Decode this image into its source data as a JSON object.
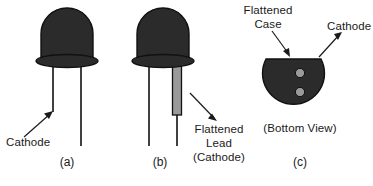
{
  "figure": {
    "colors": {
      "body_dark": "#2b2b2b",
      "lead_gray": "#9a9a9a",
      "outline": "#111111",
      "text": "#1a1a1a",
      "background": "#ffffff"
    }
  },
  "panels": [
    {
      "id": "a",
      "caption": "(a)",
      "annotations": [
        {
          "name": "cathode-label",
          "text": "Cathode"
        }
      ]
    },
    {
      "id": "b",
      "caption": "(b)",
      "annotations": [
        {
          "name": "flattened-lead-label",
          "line1": "Flattened",
          "line2": "Lead",
          "line3": "(Cathode)"
        }
      ]
    },
    {
      "id": "c",
      "caption": "(c)",
      "view_label": "(Bottom View)",
      "annotations": [
        {
          "name": "flattened-case-label",
          "line1": "Flattened",
          "line2": "Case"
        },
        {
          "name": "cathode-label",
          "text": "Cathode"
        }
      ]
    }
  ],
  "labels": {
    "panel_a_cathode": "Cathode",
    "panel_b_flattened": "Flattened",
    "panel_b_lead": "Lead",
    "panel_b_cathode": "(Cathode)",
    "panel_c_flattened": "Flattened",
    "panel_c_case": "Case",
    "panel_c_cathode": "Cathode",
    "panel_c_bottom_view": "(Bottom View)",
    "caption_a": "(a)",
    "caption_b": "(b)",
    "caption_c": "(c)"
  }
}
